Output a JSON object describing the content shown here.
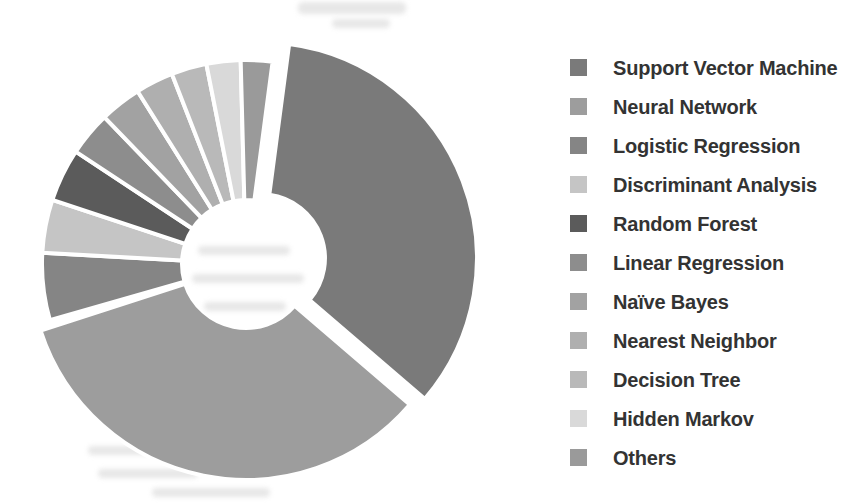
{
  "figure": {
    "kind": "scanned grayscale donut chart with legend",
    "background_color": "#ffffff"
  },
  "chart_data": {
    "type": "pie",
    "subtype": "donut",
    "title": "",
    "legend_position": "right",
    "rotation": "clockwise",
    "start_angle_deg": 7.5,
    "donut_hole_ratio": 0.3,
    "exploded_slice": "Support Vector Machine",
    "units": "percent (estimated from slice angles; no value labels printed)",
    "categories": [
      "Support Vector Machine",
      "Neural Network",
      "Logistic Regression",
      "Discriminant Analysis",
      "Random Forest",
      "Linear Regression",
      "Naïve Bayes",
      "Nearest Neighbor",
      "Decision Tree",
      "Hidden Markov",
      "Others"
    ],
    "values": [
      34.2,
      34.0,
      5.6,
      4.2,
      4.2,
      3.5,
      3.3,
      3.0,
      2.8,
      2.7,
      2.5
    ],
    "colors": [
      "#7a7a7a",
      "#9d9d9d",
      "#858585",
      "#c5c5c5",
      "#5b5b5b",
      "#8d8d8d",
      "#a2a2a2",
      "#afafaf",
      "#b9b9b9",
      "#d9d9d9",
      "#9a9a9a"
    ],
    "slice_gap_color": "#ffffff",
    "legend_text_color": "#333333"
  }
}
